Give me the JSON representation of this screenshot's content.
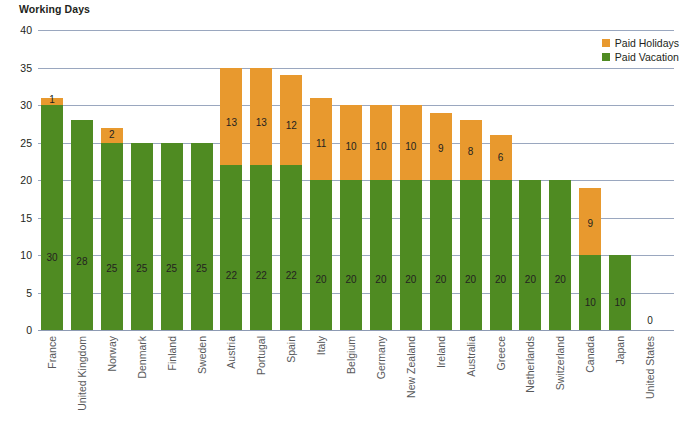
{
  "chart_data": {
    "type": "bar",
    "subtype": "stacked-bar",
    "title": "Working Days",
    "xlabel": "",
    "ylabel": "Working Days",
    "ylim": [
      0,
      40
    ],
    "ytick_step": 5,
    "yticks": [
      "0",
      "5",
      "10",
      "15",
      "20",
      "25",
      "30",
      "35",
      "40"
    ],
    "grid": true,
    "legend_position": "top-right",
    "categories": [
      "France",
      "United Kingdom",
      "Norway",
      "Denmark",
      "Finland",
      "Sweden",
      "Austria",
      "Portugal",
      "Spain",
      "Italy",
      "Belgium",
      "Germany",
      "New Zealand",
      "Ireland",
      "Australia",
      "Greece",
      "Netherlands",
      "Switzerland",
      "Canada",
      "Japan",
      "United States"
    ],
    "series": [
      {
        "name": "Paid Vacation",
        "color": "#4f8b22",
        "values": [
          30,
          28,
          25,
          25,
          25,
          25,
          22,
          22,
          22,
          20,
          20,
          20,
          20,
          20,
          20,
          20,
          20,
          20,
          10,
          10,
          0
        ]
      },
      {
        "name": "Paid Holidays",
        "color": "#e8992e",
        "values": [
          1,
          0,
          2,
          0,
          0,
          0,
          13,
          13,
          12,
          11,
          10,
          10,
          10,
          9,
          8,
          6,
          0,
          0,
          9,
          0,
          0
        ]
      }
    ],
    "totals": [
      31,
      28,
      27,
      25,
      25,
      25,
      35,
      35,
      34,
      31,
      30,
      30,
      30,
      29,
      28,
      26,
      20,
      20,
      19,
      10,
      0
    ],
    "data_labels": {
      "vacation": [
        "30",
        "28",
        "25",
        "25",
        "25",
        "25",
        "22",
        "22",
        "22",
        "20",
        "20",
        "20",
        "20",
        "20",
        "20",
        "20",
        "20",
        "20",
        "10",
        "10",
        ""
      ],
      "holidays": [
        "1",
        "",
        "2",
        "",
        "",
        "",
        "13",
        "13",
        "12",
        "11",
        "10",
        "10",
        "10",
        "9",
        "8",
        "6",
        "",
        "",
        "9",
        "",
        ""
      ]
    },
    "annotations": [
      {
        "text": "0",
        "category": "United States",
        "note": "zero value label at baseline"
      }
    ]
  },
  "legend": {
    "items": [
      {
        "label": "Paid Holidays",
        "color": "#e8992e"
      },
      {
        "label": "Paid Vacation",
        "color": "#4f8b22"
      }
    ]
  }
}
